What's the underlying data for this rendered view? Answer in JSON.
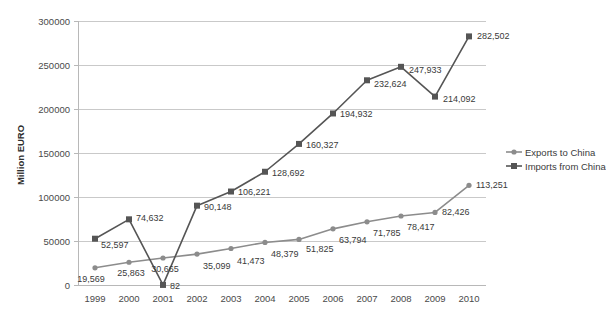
{
  "chart_data": {
    "type": "line",
    "title": "",
    "xlabel": "",
    "ylabel": "Million EURO",
    "categories": [
      "1999",
      "2000",
      "2001",
      "2002",
      "2003",
      "2004",
      "2005",
      "2006",
      "2007",
      "2008",
      "2009",
      "2010"
    ],
    "ylim": [
      0,
      300000
    ],
    "ytick_values": [
      0,
      50000,
      100000,
      150000,
      200000,
      250000,
      300000
    ],
    "ytick_labels": [
      "0",
      "50000",
      "100000",
      "150000",
      "200000",
      "250000",
      "300000"
    ],
    "grid": true,
    "legend_position": "right",
    "series": [
      {
        "name": "Exports to China",
        "marker": "circle",
        "color": "#8c8c8c",
        "values": [
          19569,
          25863,
          30665,
          35099,
          41473,
          48379,
          51825,
          63794,
          71785,
          78417,
          82426,
          113251
        ],
        "labels": [
          "19,569",
          "25,863",
          "30,665",
          "35,099",
          "41,473",
          "48,379",
          "51,825",
          "63,794",
          "71,785",
          "78,417",
          "82,426",
          "113,251"
        ]
      },
      {
        "name": "Imports from China",
        "marker": "square",
        "color": "#555555",
        "values": [
          52597,
          74632,
          82,
          90148,
          106221,
          128692,
          160327,
          194932,
          232624,
          247933,
          214092,
          282502
        ],
        "labels": [
          "52,597",
          "74,632",
          "82",
          "90,148",
          "106,221",
          "128,692",
          "160,327",
          "194,932",
          "232,624",
          "247,933",
          "214,092",
          "282,502"
        ]
      }
    ]
  },
  "legend": {
    "items": [
      {
        "label": "Exports to China"
      },
      {
        "label": "Imports from China"
      }
    ]
  }
}
